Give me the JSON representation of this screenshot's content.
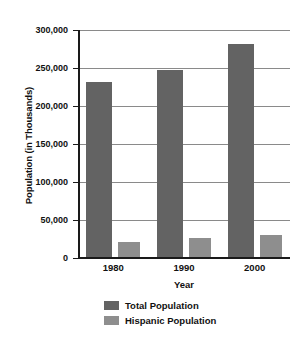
{
  "chart_data": {
    "type": "bar",
    "title": "",
    "subtitle": "",
    "xlabel": "Year",
    "ylabel": "Population (in Thousands)",
    "categories": [
      "1980",
      "1990",
      "2000"
    ],
    "series": [
      {
        "name": "Total Population",
        "color": "#636363",
        "values": [
          232000,
          247000,
          281000
        ]
      },
      {
        "name": "Hispanic Population",
        "color": "#8e8e8e",
        "values": [
          21000,
          26000,
          30000
        ]
      }
    ],
    "ylim": [
      0,
      300000
    ],
    "yticks": [
      0,
      50000,
      100000,
      150000,
      200000,
      250000,
      300000
    ],
    "ytick_labels": [
      "0",
      "50,000",
      "100,000",
      "150,000",
      "200,000",
      "250,000",
      "300,000"
    ],
    "grid": true,
    "legend_position": "bottom"
  },
  "axes": {
    "y_title": "Population (in Thousands)",
    "x_title": "Year"
  },
  "legend": {
    "entries": [
      {
        "label": "Total Population",
        "color": "#636363"
      },
      {
        "label": "Hispanic Population",
        "color": "#8e8e8e"
      }
    ]
  },
  "colors": {
    "total_population": "#636363",
    "hispanic_population": "#8e8e8e",
    "gridline": "#8a8a8a",
    "axis": "#1a1a1a",
    "background": "#ffffff",
    "text": "#111111"
  }
}
